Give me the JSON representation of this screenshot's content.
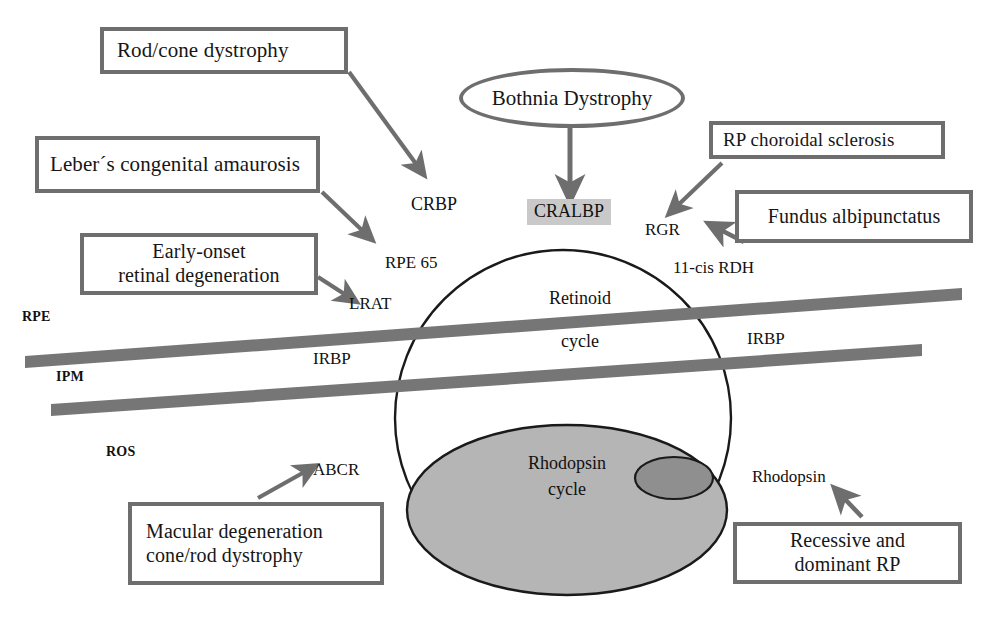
{
  "diagram": {
    "colors": {
      "box_border": "#6e6e6e",
      "arrow": "#6e6e6e",
      "band": "#767676",
      "circle_outline": "#1a1a1a",
      "rhodopsin_fill": "#b5b5b5",
      "inner_spot_fill": "#8f8f8f",
      "highlight_fill": "#c9c9c9",
      "background": "#ffffff",
      "text": "#111111"
    },
    "disease_boxes": [
      {
        "id": "rod-cone-dystrophy",
        "label": "Rod/cone dystrophy",
        "points_to": "CRBP"
      },
      {
        "id": "lebers-congenital-amaurosis",
        "label": "Leber´s congenital amaurosis",
        "points_to": "RPE 65"
      },
      {
        "id": "early-onset-retinal-degeneration",
        "line1": "Early-onset",
        "line2": "retinal degeneration",
        "points_to": "LRAT"
      },
      {
        "id": "rp-choroidal-sclerosis",
        "label": "RP choroidal sclerosis",
        "points_to": "RGR"
      },
      {
        "id": "fundus-albipunctatus",
        "label": "Fundus albipunctatus",
        "points_to": "11-cis RDH"
      },
      {
        "id": "macular-degeneration",
        "line1": "Macular degeneration",
        "line2": "cone/rod dystrophy",
        "points_to": "ABCR"
      },
      {
        "id": "recessive-dominant-rp",
        "line1": "Recessive and",
        "line2": "dominant RP",
        "points_to": "Rhodopsin"
      }
    ],
    "ellipse_node": {
      "id": "bothnia-dystrophy",
      "label": "Bothnia Dystrophy",
      "points_to": "CRALBP"
    },
    "highlighted_protein": {
      "id": "cralbp",
      "label": "CRALBP"
    },
    "protein_labels": [
      {
        "id": "crbp",
        "label": "CRBP"
      },
      {
        "id": "rpe65",
        "label": "RPE 65"
      },
      {
        "id": "lrat",
        "label": "LRAT"
      },
      {
        "id": "rgr",
        "label": "RGR"
      },
      {
        "id": "11-cis-rdh",
        "label": "11-cis RDH"
      },
      {
        "id": "abcr",
        "label": "ABCR"
      },
      {
        "id": "rhodopsin",
        "label": "Rhodopsin"
      }
    ],
    "layer_labels": [
      {
        "id": "rpe",
        "label": "RPE"
      },
      {
        "id": "ipm",
        "label": "IPM"
      },
      {
        "id": "ros",
        "label": "ROS"
      }
    ],
    "band_labels": [
      {
        "id": "irbp-left",
        "label": "IRBP"
      },
      {
        "id": "irbp-right",
        "label": "IRBP"
      }
    ],
    "cycles": [
      {
        "id": "retinoid-cycle",
        "line1": "Retinoid",
        "line2": "cycle"
      },
      {
        "id": "rhodopsin-cycle",
        "line1": "Rhodopsin",
        "line2": "cycle"
      }
    ]
  }
}
